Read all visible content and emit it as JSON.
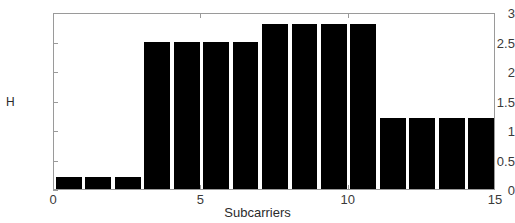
{
  "chart_data": {
    "type": "bar",
    "title": "",
    "xlabel": "Subcarriers",
    "ylabel": "H",
    "xlim": [
      0,
      15
    ],
    "ylim": [
      0,
      3
    ],
    "grid": false,
    "legend": null,
    "bar_color": "#000000",
    "axes_color": "#9a9a9a",
    "background": "#ffffff",
    "x_tick_labels": [
      "0",
      "5",
      "10",
      "15"
    ],
    "x_tick_values": [
      0,
      5,
      10,
      15
    ],
    "y_tick_labels": [
      "0",
      "0.5",
      "1",
      "1.5",
      "2",
      "2.5",
      "3"
    ],
    "y_tick_values": [
      0,
      0.5,
      1,
      1.5,
      2,
      2.5,
      3
    ],
    "categories": [
      0,
      1,
      2,
      3,
      4,
      5,
      6,
      7,
      8,
      9,
      10,
      11,
      12,
      13,
      14
    ],
    "values": [
      0.2,
      0.2,
      0.2,
      2.5,
      2.5,
      2.5,
      2.5,
      2.8,
      2.8,
      2.8,
      2.8,
      1.2,
      1.2,
      1.2,
      1.2
    ],
    "bar_width_fraction": 0.88
  }
}
